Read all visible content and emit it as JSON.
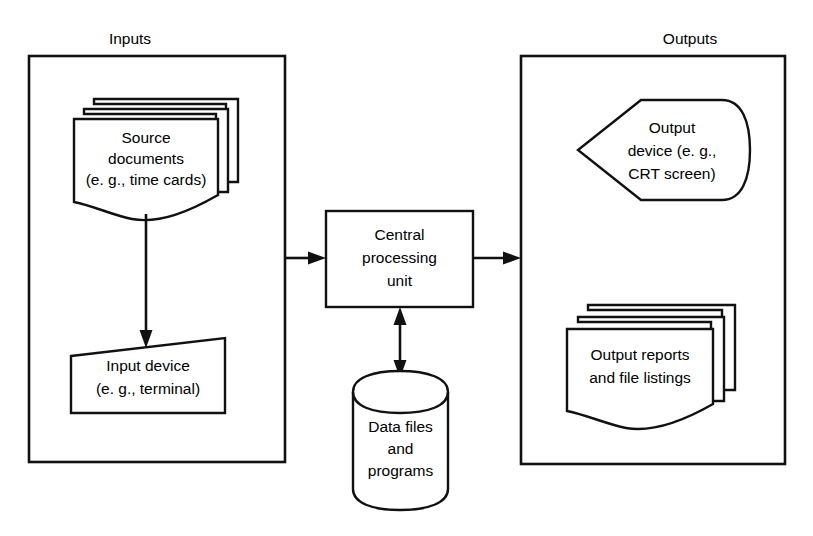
{
  "diagram": {
    "background_color": "#ffffff",
    "line_color": "#111111",
    "groups": [
      {
        "id": "inputs",
        "label": "Inputs"
      },
      {
        "id": "outputs",
        "label": "Outputs"
      }
    ],
    "nodes": [
      {
        "id": "source-documents",
        "shape": "multi-document",
        "lines": [
          "Source",
          "documents",
          "(e. g., time cards)"
        ]
      },
      {
        "id": "input-device",
        "shape": "trapezoid",
        "lines": [
          "Input device",
          "(e. g., terminal)"
        ]
      },
      {
        "id": "central-processing-unit",
        "shape": "rectangle",
        "lines": [
          "Central",
          "processing",
          "unit"
        ]
      },
      {
        "id": "data-files",
        "shape": "cylinder",
        "lines": [
          "Data files",
          "and",
          "programs"
        ]
      },
      {
        "id": "output-device",
        "shape": "display",
        "lines": [
          "Output",
          "device (e. g.,",
          "CRT screen)"
        ]
      },
      {
        "id": "output-reports",
        "shape": "multi-document",
        "lines": [
          "Output reports",
          "and file listings"
        ]
      }
    ],
    "connectors": [
      {
        "id": "source-to-input-device",
        "from": "source-documents",
        "to": "input-device",
        "direction": "single"
      },
      {
        "id": "inputs-to-cpu",
        "from": "inputs",
        "to": "central-processing-unit",
        "direction": "single"
      },
      {
        "id": "cpu-to-data-files",
        "from": "central-processing-unit",
        "to": "data-files",
        "direction": "double"
      },
      {
        "id": "cpu-to-outputs",
        "from": "central-processing-unit",
        "to": "outputs",
        "direction": "single"
      }
    ]
  }
}
